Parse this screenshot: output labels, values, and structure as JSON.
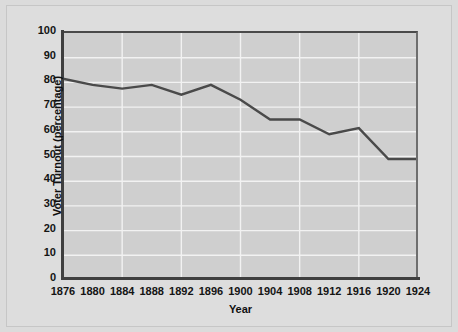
{
  "chart_data": {
    "type": "line",
    "title": "",
    "xlabel": "Year",
    "ylabel": "Voter Turnout (percentage)",
    "x": [
      1876,
      1880,
      1884,
      1888,
      1892,
      1896,
      1900,
      1904,
      1908,
      1912,
      1916,
      1920,
      1924
    ],
    "values": [
      81.5,
      79,
      77.5,
      79,
      75,
      79,
      73,
      65,
      65,
      59,
      61.5,
      49,
      49
    ],
    "series": [
      {
        "name": "Voter Turnout",
        "values": [
          81.5,
          79,
          77.5,
          79,
          75,
          79,
          73,
          65,
          65,
          59,
          61.5,
          49,
          49
        ]
      }
    ],
    "xlim": [
      1876,
      1924
    ],
    "ylim": [
      0,
      100
    ],
    "xticks": [
      "1876",
      "1880",
      "1884",
      "1888",
      "1892",
      "1896",
      "1900",
      "1904",
      "1908",
      "1912",
      "1916",
      "1920",
      "1924"
    ],
    "yticks": [
      "0",
      "10",
      "20",
      "30",
      "40",
      "50",
      "60",
      "70",
      "80",
      "90",
      "100"
    ],
    "xtick_step": 4,
    "ytick_step": 10,
    "grid": true,
    "legend": "none",
    "colors": {
      "line": "#4a4a4a",
      "plot_background": "#cfcfcf",
      "page_background": "#dddddd",
      "gridline": "#f2f2f2",
      "axis": "#3f3f3f",
      "text": "#101010"
    },
    "line_width": 2.4
  }
}
